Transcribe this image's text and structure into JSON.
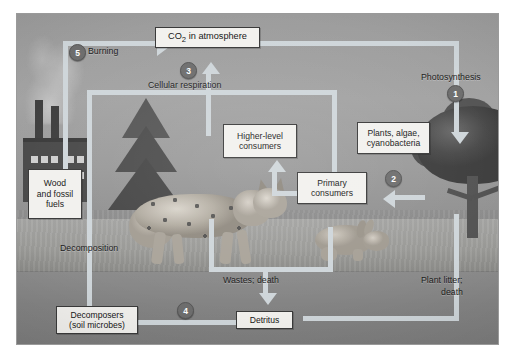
{
  "figure": {
    "frame": {
      "border_color": "#3a3a3a",
      "sky_color": "#9d9d9d",
      "soil_color": "#848484"
    }
  },
  "boxes": [
    {
      "id": "co2",
      "label": "CO2 in atmosphere",
      "html_label": "CO<sub>2</sub> in atmosphere"
    },
    {
      "id": "wood",
      "label": "Wood and fossil fuels",
      "lines": [
        "Wood",
        "and fossil",
        "fuels"
      ]
    },
    {
      "id": "higher",
      "label": "Higher-level consumers",
      "lines": [
        "Higher-level",
        "consumers"
      ]
    },
    {
      "id": "plants",
      "label": "Plants, algae, cyanobacteria",
      "lines": [
        "Plants, algae,",
        "cyanobacteria"
      ]
    },
    {
      "id": "primary",
      "label": "Primary consumers",
      "lines": [
        "Primary",
        "consumers"
      ]
    },
    {
      "id": "decomposers",
      "label": "Decomposers (soil microbes)",
      "lines": [
        "Decomposers",
        "(soil microbes)"
      ]
    },
    {
      "id": "detritus",
      "label": "Detritus",
      "lines": [
        "Detritus"
      ]
    }
  ],
  "labels": {
    "burning": "Burning",
    "cellular_respiration": "Cellular respiration",
    "photosynthesis": "Photosynthesis",
    "decomposition": "Decomposition",
    "wastes_death": "Wastes; death",
    "plant_litter": "Plant litter;",
    "plant_litter2": "death"
  },
  "badges": {
    "one": "1",
    "two": "2",
    "three": "3",
    "four": "4",
    "five": "5"
  },
  "badge_meanings": {
    "1": "Photosynthesis",
    "2": "Consumption of producers by primary consumers",
    "3": "Cellular respiration",
    "4": "Decomposition of detritus",
    "5": "Burning of wood and fossil fuels"
  },
  "colors": {
    "arrow": "#cfd6da",
    "badge": "#6e6e6e",
    "box_fill": "#f2f1ee",
    "box_border": "#3a3a3a"
  }
}
